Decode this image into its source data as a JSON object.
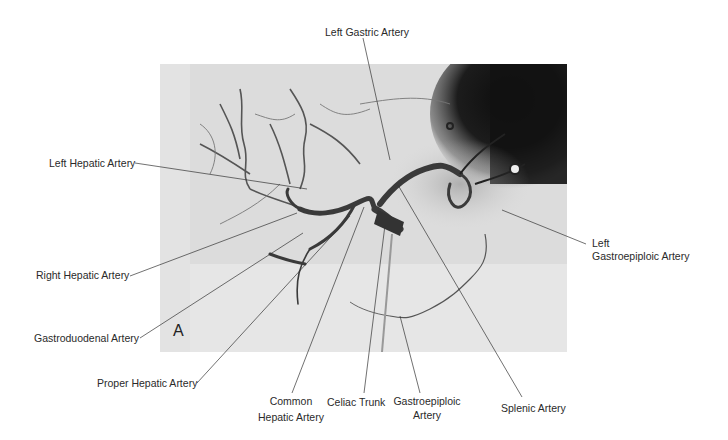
{
  "figure": {
    "panel_letter": "A",
    "image_description": "Celiac arteriogram (grayscale angiographic image)",
    "labels": {
      "left_gastric": "Left Gastric Artery",
      "left_hepatic": "Left Hepatic Artery",
      "right_hepatic": "Right Hepatic Artery",
      "gastroduodenal": "Gastroduodenal Artery",
      "proper_hepatic": "Proper Hepatic Artery",
      "common_hepatic_1": "Common",
      "common_hepatic_2": "Hepatic Artery",
      "celiac_trunk": "Celiac Trunk",
      "gastroepiploic_1": "Gastroepiploic",
      "gastroepiploic_2": "Artery",
      "splenic": "Splenic Artery",
      "left_gastroepiploic_1": "Left",
      "left_gastroepiploic_2": "Gastroepiploic Artery"
    }
  }
}
